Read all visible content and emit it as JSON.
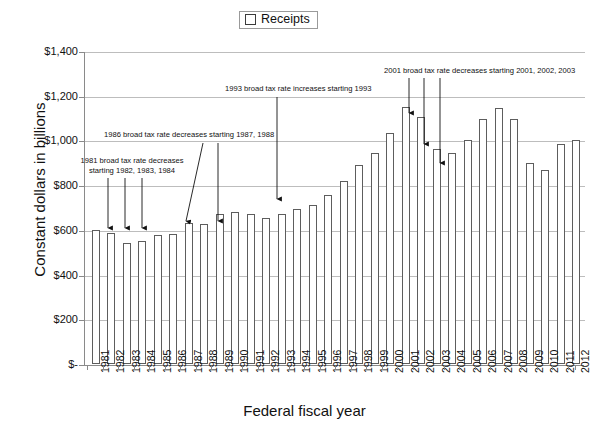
{
  "legend": {
    "label": "Receipts",
    "swatch_color": "#ffffff",
    "swatch_border": "#3b3b3b"
  },
  "axes": {
    "y_title": "Constant dollars in billions",
    "x_title": "Federal fiscal year"
  },
  "annotations": {
    "a": "1981 broad tax rate decreases\nstarting 1982, 1983, 1984",
    "b": "1986 broad tax rate decreases starting 1987, 1988",
    "c": "1993 broad tax rate increases starting 1993",
    "d": "2001 broad tax rate decreases starting 2001, 2002, 2003"
  },
  "chart_data": {
    "type": "bar",
    "title": "",
    "xlabel": "Federal fiscal year",
    "ylabel": "Constant dollars in billions",
    "ylim": [
      0,
      1400
    ],
    "ytick_labels": [
      "$-",
      "$200",
      "$400",
      "$600",
      "$800",
      "$1,000",
      "$1,200",
      "$1,400"
    ],
    "ytick_values": [
      0,
      200,
      400,
      600,
      800,
      1000,
      1200,
      1400
    ],
    "grid": true,
    "legend_position": "top-center",
    "series_name": "Receipts",
    "categories": [
      "1981",
      "1982",
      "1983",
      "1984",
      "1985",
      "1986",
      "1987",
      "1988",
      "1989",
      "1990",
      "1991",
      "1992",
      "1993",
      "1994",
      "1995",
      "1996",
      "1997",
      "1998",
      "1999",
      "2000",
      "2001",
      "2002",
      "2003",
      "2004",
      "2005",
      "2006",
      "2007",
      "2008",
      "2009",
      "2010",
      "2011",
      "2012"
    ],
    "values": [
      600,
      585,
      540,
      550,
      575,
      580,
      632,
      628,
      672,
      678,
      670,
      652,
      672,
      692,
      712,
      757,
      818,
      890,
      945,
      1035,
      1150,
      1105,
      960,
      945,
      1000,
      1095,
      1143,
      1098,
      900,
      870,
      985,
      1000
    ]
  }
}
